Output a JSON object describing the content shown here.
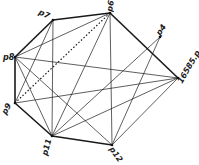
{
  "diagram": {
    "type": "graph",
    "nodes": [
      {
        "id": "p7",
        "label": "p7",
        "x": 53,
        "y": 20,
        "lx": 38,
        "ly": 14,
        "rot": 25
      },
      {
        "id": "p6",
        "label": "p6",
        "x": 110,
        "y": 13,
        "lx": 112,
        "ly": 12,
        "rot": -80
      },
      {
        "id": "p8",
        "label": "p8",
        "x": 15,
        "y": 57,
        "lx": 3,
        "ly": 60,
        "rot": 0
      },
      {
        "id": "p9",
        "label": "p9",
        "x": 15,
        "y": 103,
        "lx": 6,
        "ly": 115,
        "rot": -60
      },
      {
        "id": "p11",
        "label": "p11",
        "x": 52,
        "y": 136,
        "lx": 47,
        "ly": 156,
        "rot": -75
      },
      {
        "id": "p12",
        "label": "p12",
        "x": 112,
        "y": 145,
        "lx": 109,
        "ly": 149,
        "rot": 55
      },
      {
        "id": "p4",
        "label": "p4",
        "x": 160,
        "y": 37,
        "lx": 160,
        "ly": 36,
        "rot": -55
      },
      {
        "id": "n16585",
        "label": "16585.p..",
        "x": 178,
        "y": 78,
        "lx": 182,
        "ly": 84,
        "rot": -60
      }
    ],
    "edges": [
      {
        "from": "p8",
        "to": "p7",
        "style": "thick"
      },
      {
        "from": "p7",
        "to": "p6",
        "style": "thick"
      },
      {
        "from": "p6",
        "to": "n16585",
        "style": "thick"
      },
      {
        "from": "n16585",
        "to": "p12",
        "style": "thin"
      },
      {
        "from": "p12",
        "to": "p11",
        "style": "thick"
      },
      {
        "from": "p11",
        "to": "p9",
        "style": "thick"
      },
      {
        "from": "p9",
        "to": "p8",
        "style": "thick"
      },
      {
        "from": "p6",
        "to": "p9",
        "style": "dotted"
      },
      {
        "from": "p6",
        "to": "p8",
        "style": "thin"
      },
      {
        "from": "p6",
        "to": "p11",
        "style": "thin"
      },
      {
        "from": "p6",
        "to": "p12",
        "style": "thin"
      },
      {
        "from": "p7",
        "to": "p11",
        "style": "thin"
      },
      {
        "from": "p7",
        "to": "p9",
        "style": "thin"
      },
      {
        "from": "p8",
        "to": "n16585",
        "style": "thin"
      },
      {
        "from": "p8",
        "to": "p11",
        "style": "thin"
      },
      {
        "from": "p8",
        "to": "p12",
        "style": "thin"
      },
      {
        "from": "p9",
        "to": "n16585",
        "style": "thin"
      },
      {
        "from": "p11",
        "to": "n16585",
        "style": "thin"
      },
      {
        "from": "p4",
        "to": "p11",
        "style": "thin"
      },
      {
        "from": "p4",
        "to": "p12",
        "style": "thin"
      }
    ]
  }
}
